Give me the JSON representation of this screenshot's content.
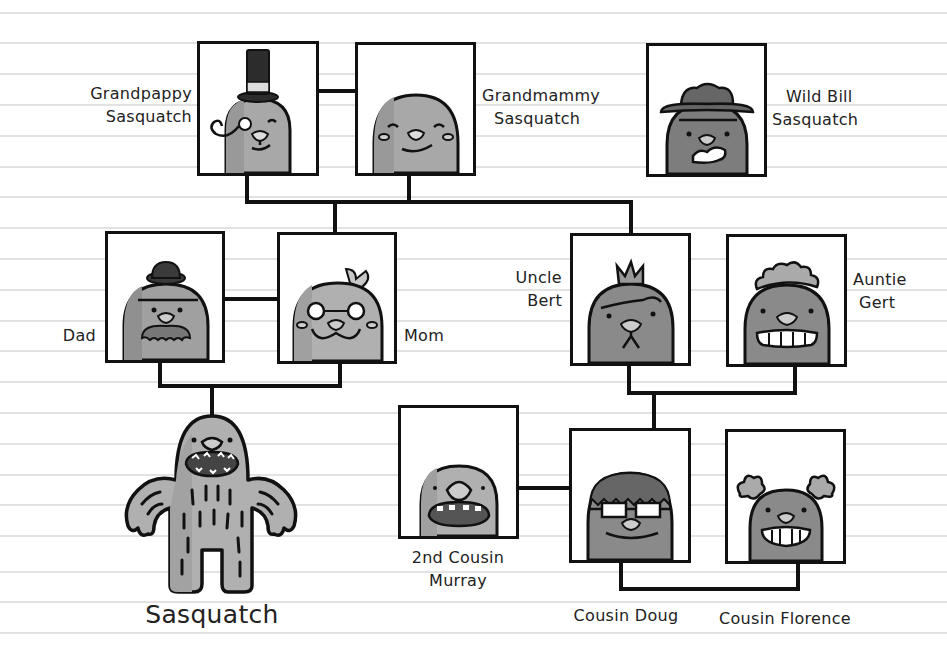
{
  "diagram": {
    "type": "family-tree",
    "background": {
      "paper": "#ffffff",
      "rule_color": "#e2e2e2"
    },
    "colors": {
      "outline": "#111111",
      "fur_light": "#b5b5b5",
      "fur_mid": "#9a9a9a",
      "fur_dark": "#7d7d7d",
      "hat": "#3a3a3a"
    }
  },
  "members": {
    "grandpappy": {
      "line1": "Grandpappy",
      "line2": "Sasquatch",
      "accessory": "top-hat-monocle"
    },
    "grandmammy": {
      "line1": "Grandmammy",
      "line2": "Sasquatch",
      "accessory": "none"
    },
    "wildbill": {
      "line1": "Wild Bill",
      "line2": "Sasquatch",
      "accessory": "cowboy-hat"
    },
    "dad": {
      "line1": "Dad",
      "accessory": "bowler-hat-mustache"
    },
    "mom": {
      "line1": "Mom",
      "accessory": "bow-glasses"
    },
    "bert": {
      "line1": "Uncle",
      "line2": "Bert",
      "accessory": "tuft"
    },
    "gert": {
      "line1": "Auntie",
      "line2": "Gert",
      "accessory": "curly-hair"
    },
    "murray": {
      "line1": "2nd Cousin",
      "line2": "Murray",
      "accessory": "none"
    },
    "doug": {
      "line1": "Cousin Doug",
      "accessory": "glasses"
    },
    "florence": {
      "line1": "Cousin Florence",
      "accessory": "pigtails"
    },
    "sasquatch": {
      "line1": "Sasquatch",
      "accessory": "full-body"
    }
  },
  "relations": [
    {
      "from": "grandpappy",
      "to": "grandmammy",
      "type": "spouse"
    },
    {
      "from": "grandpappy+grandmammy",
      "to": "mom",
      "type": "child"
    },
    {
      "from": "grandpappy+grandmammy",
      "to": "bert",
      "type": "child"
    },
    {
      "from": "dad",
      "to": "mom",
      "type": "spouse"
    },
    {
      "from": "dad+mom",
      "to": "sasquatch",
      "type": "child"
    },
    {
      "from": "bert",
      "to": "gert",
      "type": "spouse"
    },
    {
      "from": "bert+gert",
      "to": "doug",
      "type": "child"
    },
    {
      "from": "murray",
      "to": "doug",
      "type": "cousin"
    },
    {
      "from": "doug",
      "to": "florence",
      "type": "sibling"
    }
  ]
}
